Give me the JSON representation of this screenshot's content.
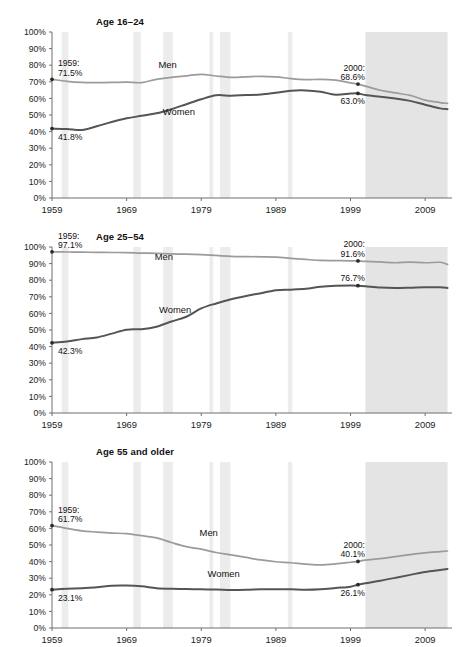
{
  "figure": {
    "top_partial_text": "",
    "footnote_partial_text": ""
  },
  "axis": {
    "y_ticks": [
      "100%",
      "90%",
      "80%",
      "70%",
      "60%",
      "50%",
      "40%",
      "30%",
      "20%",
      "10%",
      "0%"
    ],
    "x_ticks": [
      "1959",
      "1969",
      "1979",
      "1989",
      "1999",
      "2009"
    ]
  },
  "series_labels": {
    "men": "Men",
    "women": "Women"
  },
  "colors": {
    "men_line": "#9b9b9b",
    "women_line": "#555555",
    "recession_band": "#ececec",
    "projection_band": "#e4e4e4",
    "axis": "#6f6f6f",
    "text": "#1a1a1a"
  },
  "panels": [
    {
      "id": "age-16-24",
      "title": "Age 16–24",
      "annotations": {
        "start_year": "1959:",
        "men_start_value": "71.5%",
        "women_start_value": "41.8%",
        "mid_year": "2000:",
        "men_mid_value": "68.6%",
        "women_mid_value": "63.0%"
      },
      "men_label": "Men",
      "women_label": "Women"
    },
    {
      "id": "age-25-54",
      "title": "Age 25–54",
      "annotations": {
        "start_year": "1959:",
        "men_start_value": "97.1%",
        "women_start_value": "42.3%",
        "mid_year": "2000:",
        "men_mid_value": "91.6%",
        "women_mid_value": "76.7%"
      },
      "men_label": "Men",
      "women_label": "Women"
    },
    {
      "id": "age-55-and-older",
      "title": "Age 55 and older",
      "annotations": {
        "start_year": "1959:",
        "men_start_value": "61.7%",
        "women_start_value": "23.1%",
        "mid_year": "2000:",
        "men_mid_value": "40.1%",
        "women_mid_value": "26.1%"
      },
      "men_label": "Men",
      "women_label": "Women"
    }
  ],
  "chart_data": [
    {
      "type": "line",
      "title": "Age 16–24",
      "xlabel": "",
      "ylabel": "",
      "ylim": [
        0,
        100
      ],
      "xlim": [
        1959,
        2012
      ],
      "grid": false,
      "legend": "inline-labels",
      "x": [
        1959,
        1961,
        1963,
        1965,
        1967,
        1969,
        1971,
        1973,
        1975,
        1977,
        1979,
        1981,
        1983,
        1985,
        1987,
        1989,
        1991,
        1993,
        1995,
        1997,
        1999,
        2000,
        2001,
        2003,
        2005,
        2007,
        2009,
        2011,
        2012
      ],
      "series": [
        {
          "name": "Men",
          "values": [
            71.5,
            70.3,
            69.6,
            69.5,
            69.6,
            69.8,
            69.5,
            71.5,
            72.7,
            73.6,
            74.5,
            73.5,
            72.7,
            73.0,
            73.3,
            73.0,
            71.9,
            71.3,
            71.5,
            71.0,
            69.4,
            68.6,
            67.4,
            64.9,
            63.3,
            61.8,
            59.0,
            57.5,
            57.0
          ]
        },
        {
          "name": "Women",
          "values": [
            41.8,
            41.6,
            41.0,
            43.2,
            45.8,
            48.0,
            49.5,
            51.0,
            53.5,
            56.5,
            59.5,
            61.9,
            61.6,
            62.0,
            62.3,
            63.4,
            64.6,
            64.8,
            64.0,
            62.2,
            62.9,
            63.0,
            62.0,
            61.0,
            60.0,
            58.5,
            56.2,
            54.0,
            53.5
          ]
        }
      ],
      "annotations": [
        {
          "text": "1959: 71.5%",
          "x": 1959,
          "y": 71.5,
          "series": "Men"
        },
        {
          "text": "41.8%",
          "x": 1959,
          "y": 41.8,
          "series": "Women"
        },
        {
          "text": "2000: 68.6%",
          "x": 2000,
          "y": 68.6,
          "series": "Men"
        },
        {
          "text": "63.0%",
          "x": 2000,
          "y": 63.0,
          "series": "Women"
        }
      ]
    },
    {
      "type": "line",
      "title": "Age 25–54",
      "xlabel": "",
      "ylabel": "",
      "ylim": [
        0,
        100
      ],
      "xlim": [
        1959,
        2012
      ],
      "grid": false,
      "legend": "inline-labels",
      "x": [
        1959,
        1961,
        1963,
        1965,
        1967,
        1969,
        1971,
        1973,
        1975,
        1977,
        1979,
        1981,
        1983,
        1985,
        1987,
        1989,
        1991,
        1993,
        1995,
        1997,
        1999,
        2000,
        2001,
        2003,
        2005,
        2007,
        2009,
        2011,
        2012
      ],
      "series": [
        {
          "name": "Men",
          "values": [
            97.1,
            97.0,
            96.9,
            96.8,
            96.7,
            96.6,
            96.3,
            96.2,
            95.8,
            95.7,
            95.4,
            94.9,
            94.4,
            94.2,
            94.1,
            93.9,
            93.2,
            92.5,
            91.9,
            91.8,
            91.7,
            91.6,
            91.3,
            91.0,
            90.5,
            90.9,
            90.5,
            90.8,
            89.5
          ]
        },
        {
          "name": "Women",
          "values": [
            42.3,
            43.1,
            44.5,
            45.5,
            47.8,
            50.2,
            50.5,
            52.0,
            55.1,
            58.0,
            63.0,
            66.0,
            68.5,
            70.5,
            72.2,
            74.0,
            74.3,
            74.8,
            76.0,
            76.6,
            76.8,
            76.7,
            76.4,
            75.6,
            75.3,
            75.5,
            75.8,
            75.7,
            75.3
          ]
        }
      ],
      "annotations": [
        {
          "text": "1959: 97.1%",
          "x": 1959,
          "y": 97.1,
          "series": "Men"
        },
        {
          "text": "42.3%",
          "x": 1959,
          "y": 42.3,
          "series": "Women"
        },
        {
          "text": "2000: 91.6%",
          "x": 2000,
          "y": 91.6,
          "series": "Men"
        },
        {
          "text": "76.7%",
          "x": 2000,
          "y": 76.7,
          "series": "Women"
        }
      ]
    },
    {
      "type": "line",
      "title": "Age 55 and older",
      "xlabel": "",
      "ylabel": "",
      "ylim": [
        0,
        100
      ],
      "xlim": [
        1959,
        2012
      ],
      "grid": false,
      "legend": "inline-labels",
      "x": [
        1959,
        1961,
        1963,
        1965,
        1967,
        1969,
        1971,
        1973,
        1975,
        1977,
        1979,
        1981,
        1983,
        1985,
        1987,
        1989,
        1991,
        1993,
        1995,
        1997,
        1999,
        2000,
        2001,
        2003,
        2005,
        2007,
        2009,
        2011,
        2012
      ],
      "series": [
        {
          "name": "Men",
          "values": [
            61.7,
            60.0,
            58.5,
            57.8,
            57.2,
            56.8,
            55.6,
            54.3,
            51.5,
            49.0,
            47.5,
            45.5,
            44.0,
            42.5,
            41.0,
            39.9,
            39.3,
            38.5,
            38.0,
            38.6,
            39.6,
            40.1,
            40.9,
            41.8,
            43.0,
            44.2,
            45.2,
            46.0,
            46.4
          ]
        },
        {
          "name": "Women",
          "values": [
            23.1,
            23.6,
            24.0,
            24.5,
            25.5,
            25.6,
            25.1,
            24.0,
            23.6,
            23.5,
            23.3,
            23.2,
            22.9,
            23.0,
            23.3,
            23.4,
            23.3,
            23.0,
            23.3,
            24.1,
            24.9,
            26.1,
            27.0,
            28.5,
            30.2,
            32.0,
            33.8,
            35.0,
            35.6
          ]
        }
      ],
      "annotations": [
        {
          "text": "1959: 61.7%",
          "x": 1959,
          "y": 61.7,
          "series": "Men"
        },
        {
          "text": "23.1%",
          "x": 1959,
          "y": 23.1,
          "series": "Women"
        },
        {
          "text": "2000: 40.1%",
          "x": 2000,
          "y": 40.1,
          "series": "Men"
        },
        {
          "text": "26.1%",
          "x": 2000,
          "y": 26.1,
          "series": "Women"
        }
      ]
    }
  ],
  "shading": {
    "recessions": [
      [
        1960.3,
        1961.2
      ],
      [
        1969.9,
        1970.9
      ],
      [
        1973.9,
        1975.2
      ],
      [
        1980.1,
        1980.6
      ],
      [
        1981.5,
        1982.9
      ],
      [
        1990.6,
        1991.2
      ]
    ],
    "projection": [
      2001.0,
      2012.0
    ]
  }
}
